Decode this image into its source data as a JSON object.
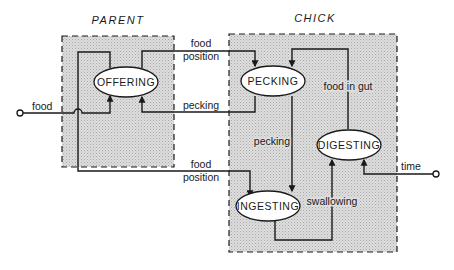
{
  "diagram": {
    "type": "state-transition",
    "colors": {
      "ink": "#1a1a1a",
      "box_fill": "#d4d4d4",
      "background": "#ffffff"
    },
    "groups": [
      {
        "id": "parent",
        "title": "PARENT"
      },
      {
        "id": "chick",
        "title": "CHICK"
      }
    ],
    "states": [
      {
        "id": "offering",
        "label": "OFFERING",
        "group": "parent"
      },
      {
        "id": "pecking",
        "label": "PECKING",
        "group": "chick"
      },
      {
        "id": "digesting",
        "label": "DIGESTING",
        "group": "chick"
      },
      {
        "id": "ingesting",
        "label": "INGESTING",
        "group": "chick"
      }
    ],
    "signals": {
      "food_input": "food",
      "food_position_top_1": "food",
      "food_position_top_2": "position",
      "pecking_top": "pecking",
      "food_position_bottom_1": "food",
      "food_position_bottom_2": "position",
      "food_in_gut": "food in gut",
      "pecking_inner": "pecking",
      "swallowing": "swallowing",
      "time_output": "time"
    },
    "edges": [
      {
        "from": "food (input)",
        "to": "offering",
        "label": "food"
      },
      {
        "from": "offering",
        "to": "pecking",
        "label": "food position"
      },
      {
        "from": "pecking",
        "to": "offering",
        "label": "pecking"
      },
      {
        "from": "food (input)",
        "to": "ingesting",
        "label": "food position"
      },
      {
        "from": "digesting",
        "to": "pecking",
        "label": "food in gut"
      },
      {
        "from": "pecking",
        "to": "ingesting",
        "label": "pecking"
      },
      {
        "from": "ingesting",
        "to": "digesting",
        "label": "swallowing"
      },
      {
        "from": "time (input)",
        "to": "digesting",
        "label": "time"
      }
    ]
  }
}
